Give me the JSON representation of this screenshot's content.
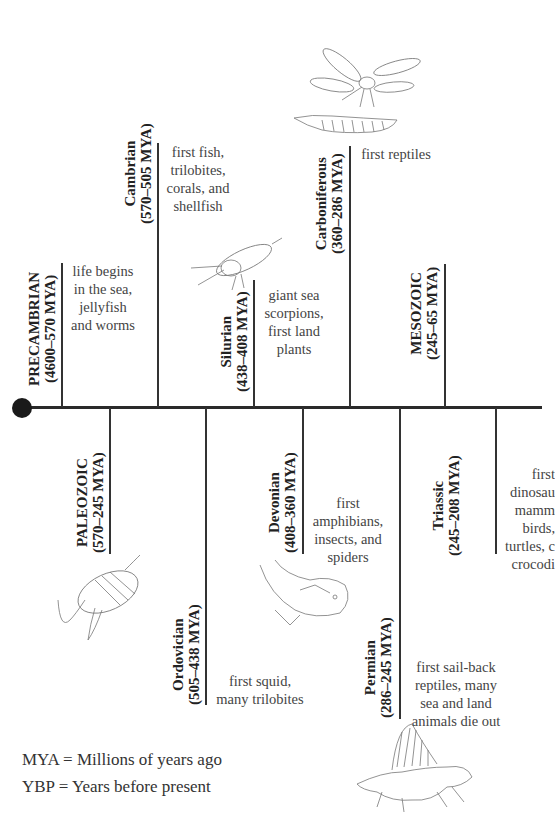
{
  "periods_above": [
    {
      "name": "PRECAMBRIAN",
      "range": "(4600–570 MYA)",
      "desc": [
        "life begins",
        "in the sea,",
        "jellyfish",
        "and worms"
      ],
      "type": "era"
    },
    {
      "name": "Cambrian",
      "range": "(570–505 MYA)",
      "desc": [
        "first fish,",
        "trilobites,",
        "corals, and",
        "shellfish"
      ],
      "type": "period"
    },
    {
      "name": "Silurian",
      "range": "(438–408 MYA)",
      "desc": [
        "giant sea",
        "scorpions,",
        "first land",
        "plants"
      ],
      "type": "period"
    },
    {
      "name": "Carboniferous",
      "range": "(360–286 MYA)",
      "desc": [
        "first reptiles"
      ],
      "type": "period"
    },
    {
      "name": "MESOZOIC",
      "range": "(245–65 MYA)",
      "desc": [],
      "type": "era"
    }
  ],
  "periods_below": [
    {
      "name": "PALEOZOIC",
      "range": "(570–245 MYA)",
      "desc": [],
      "type": "era"
    },
    {
      "name": "Ordovician",
      "range": "(505–438 MYA)",
      "desc": [
        "first squid,",
        "many trilobites"
      ],
      "type": "period"
    },
    {
      "name": "Devonian",
      "range": "(408–360 MYA)",
      "desc": [
        "first",
        "amphibians,",
        "insects, and",
        "spiders"
      ],
      "type": "period"
    },
    {
      "name": "Permian",
      "range": "(286–245 MYA)",
      "desc": [
        "first sail-back",
        "reptiles, many",
        "sea and land",
        "animals die out"
      ],
      "type": "period"
    },
    {
      "name": "Triassic",
      "range": "(245–208 MYA)",
      "desc": [
        "first",
        "dinosau",
        "mamm",
        "birds,",
        "turtles, c",
        "crocodi"
      ],
      "type": "period"
    }
  ],
  "legend": [
    "MYA = Millions of years ago",
    "YBP = Years before present"
  ],
  "illustrations": [
    "dragonfly",
    "millipede",
    "sea-scorpion",
    "trilobite",
    "armored-fish",
    "dimetrodon"
  ]
}
